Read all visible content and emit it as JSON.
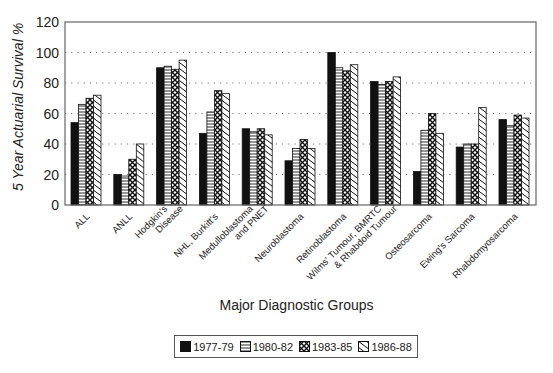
{
  "chart_data": {
    "type": "bar",
    "title": "",
    "xlabel": "Major Diagnostic Groups",
    "ylabel": "5 Year Actuarial Survival %",
    "ylim": [
      0,
      120
    ],
    "yticks": [
      0,
      20,
      40,
      60,
      80,
      100,
      120
    ],
    "grid": "horizontal dotted",
    "legend_position": "bottom",
    "categories": [
      "ALL",
      "ANLL",
      "Hodgkin's Disease",
      "NHL, Burkitt's",
      "Medulloblastoma and PNET",
      "Neuroblastoma",
      "Retinoblastoma",
      "Wilms' Tumour, BMRTC & Rhabdoid Tumour",
      "Osteosarcoma",
      "Ewing's Sarcoma",
      "Rhabdomyosarcoma"
    ],
    "category_label_lines": [
      [
        "ALL"
      ],
      [
        "ANLL"
      ],
      [
        "Hodgkin's",
        "Disease"
      ],
      [
        "NHL, Burkitt's"
      ],
      [
        "Medulloblastoma",
        "and PNET"
      ],
      [
        "Neuroblastoma"
      ],
      [
        "Retinoblastoma"
      ],
      [
        "Wilms' Tumour, BMRTC",
        "& Rhabdoid Tumour"
      ],
      [
        "Osteosarcoma"
      ],
      [
        "Ewing's Sarcoma"
      ],
      [
        "Rhabdomyosarcoma"
      ]
    ],
    "series": [
      {
        "name": "1977-79",
        "pattern": "solid",
        "values": [
          54,
          20,
          90,
          47,
          50,
          29,
          100,
          81,
          22,
          38,
          56
        ]
      },
      {
        "name": "1980-82",
        "pattern": "horizontal",
        "values": [
          66,
          19,
          91,
          61,
          48,
          37,
          90,
          79,
          49,
          40,
          52
        ]
      },
      {
        "name": "1983-85",
        "pattern": "crosshatch",
        "values": [
          70,
          30,
          89,
          75,
          50,
          43,
          88,
          81,
          60,
          40,
          59
        ]
      },
      {
        "name": "1986-88",
        "pattern": "diagonal",
        "values": [
          72,
          40,
          95,
          73,
          46,
          37,
          92,
          84,
          47,
          64,
          57
        ]
      }
    ]
  },
  "labels": {
    "ylabel": "5 Year Actuarial Survival %",
    "xlabel": "Major Diagnostic Groups",
    "legend": [
      "1977-79",
      "1980-82",
      "1983-85",
      "1986-88"
    ]
  }
}
